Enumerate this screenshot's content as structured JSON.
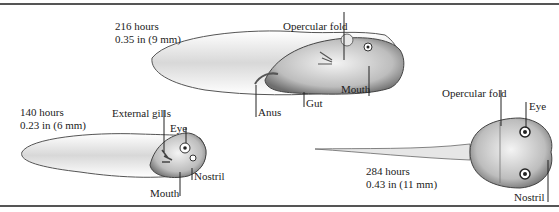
{
  "diagram": {
    "stages": [
      {
        "id": "stage-140",
        "time": "140 hours",
        "size": "0.23 in (6 mm)",
        "labels": [
          "External gills",
          "Eye",
          "Nostril",
          "Mouth"
        ]
      },
      {
        "id": "stage-216",
        "time": "216 hours",
        "size": "0.35 in (9 mm)",
        "labels": [
          "Opercular fold",
          "Mouth",
          "Gut",
          "Anus"
        ]
      },
      {
        "id": "stage-284",
        "time": "284 hours",
        "size": "0.43 in (11 mm)",
        "labels": [
          "Opercular fold",
          "Eye",
          "Nostril"
        ]
      }
    ],
    "colors": {
      "ink": "#222222",
      "body_shade": "#8a8a8a",
      "rule": "#555555",
      "background": "#ffffff"
    }
  }
}
